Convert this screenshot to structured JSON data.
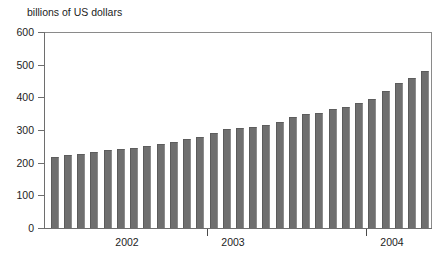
{
  "chart_data": {
    "type": "bar",
    "title": "billions of US dollars",
    "xlabel": "",
    "ylabel": "billions of US dollars",
    "ylim": [
      0,
      600
    ],
    "yticks": [
      0,
      100,
      200,
      300,
      400,
      500,
      600
    ],
    "ytick_labels": [
      "0",
      "100",
      "200",
      "300",
      "400",
      "500",
      "600"
    ],
    "grid": false,
    "legend": null,
    "bar_color": "#6f6f6f",
    "axis_color": "#6e6e6e",
    "xtick_labels": [
      "2002",
      "2003",
      "2004"
    ],
    "x_group_dividers": [
      "2003",
      "2004"
    ],
    "categories": [
      "2002-01",
      "2002-02",
      "2002-03",
      "2002-04",
      "2002-05",
      "2002-06",
      "2002-07",
      "2002-08",
      "2002-09",
      "2002-10",
      "2002-11",
      "2002-12",
      "2003-01",
      "2003-02",
      "2003-03",
      "2003-04",
      "2003-05",
      "2003-06",
      "2003-07",
      "2003-08",
      "2003-09",
      "2003-10",
      "2003-11",
      "2003-12",
      "2004-01",
      "2004-02",
      "2004-03",
      "2004-04"
    ],
    "values": [
      218,
      222,
      228,
      232,
      238,
      243,
      245,
      252,
      258,
      262,
      272,
      278,
      290,
      304,
      306,
      309,
      316,
      324,
      340,
      348,
      352,
      364,
      370,
      384,
      396,
      418,
      444,
      458
    ],
    "extra_values": [
      482
    ],
    "value_unit": "billions of US dollars"
  },
  "labels": {
    "axis_title": "billions of US dollars"
  }
}
